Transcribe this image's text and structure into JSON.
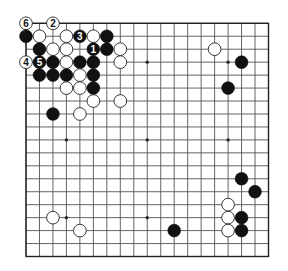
{
  "diagram": {
    "type": "go-board",
    "size": 19,
    "colors": {
      "background": "#ffffff",
      "grid": "#555555",
      "border": "#222222",
      "black_stone": "#111111",
      "white_stone": "#ffffff"
    },
    "hoshi": [
      [
        3,
        3
      ],
      [
        9,
        3
      ],
      [
        15,
        3
      ],
      [
        3,
        9
      ],
      [
        9,
        9
      ],
      [
        15,
        9
      ],
      [
        3,
        15
      ],
      [
        9,
        15
      ],
      [
        15,
        15
      ]
    ],
    "stones": [
      {
        "color": "white",
        "col": 0,
        "row": 0,
        "label": "6"
      },
      {
        "color": "white",
        "col": 2,
        "row": 0,
        "label": "2"
      },
      {
        "color": "black",
        "col": 0,
        "row": 1,
        "label": ""
      },
      {
        "color": "white",
        "col": 1,
        "row": 1,
        "label": ""
      },
      {
        "color": "white",
        "col": 3,
        "row": 1,
        "label": ""
      },
      {
        "color": "black",
        "col": 4,
        "row": 1,
        "label": "3"
      },
      {
        "color": "white",
        "col": 5,
        "row": 1,
        "label": ""
      },
      {
        "color": "black",
        "col": 6,
        "row": 1,
        "label": ""
      },
      {
        "color": "black",
        "col": 1,
        "row": 2,
        "label": ""
      },
      {
        "color": "white",
        "col": 2,
        "row": 2,
        "label": ""
      },
      {
        "color": "white",
        "col": 3,
        "row": 2,
        "label": ""
      },
      {
        "color": "black",
        "col": 5,
        "row": 2,
        "label": "1"
      },
      {
        "color": "black",
        "col": 6,
        "row": 2,
        "label": ""
      },
      {
        "color": "white",
        "col": 7,
        "row": 2,
        "label": ""
      },
      {
        "color": "white",
        "col": 14,
        "row": 2,
        "label": ""
      },
      {
        "color": "white",
        "col": 0,
        "row": 3,
        "label": "4"
      },
      {
        "color": "black",
        "col": 1,
        "row": 3,
        "label": "5"
      },
      {
        "color": "black",
        "col": 2,
        "row": 3,
        "label": ""
      },
      {
        "color": "white",
        "col": 3,
        "row": 3,
        "label": ""
      },
      {
        "color": "black",
        "col": 4,
        "row": 3,
        "label": ""
      },
      {
        "color": "black",
        "col": 5,
        "row": 3,
        "label": ""
      },
      {
        "color": "white",
        "col": 7,
        "row": 3,
        "label": ""
      },
      {
        "color": "black",
        "col": 16,
        "row": 3,
        "label": ""
      },
      {
        "color": "black",
        "col": 1,
        "row": 4,
        "label": ""
      },
      {
        "color": "black",
        "col": 2,
        "row": 4,
        "label": ""
      },
      {
        "color": "black",
        "col": 3,
        "row": 4,
        "label": ""
      },
      {
        "color": "white",
        "col": 4,
        "row": 4,
        "label": ""
      },
      {
        "color": "black",
        "col": 5,
        "row": 4,
        "label": ""
      },
      {
        "color": "white",
        "col": 3,
        "row": 5,
        "label": ""
      },
      {
        "color": "white",
        "col": 4,
        "row": 5,
        "label": ""
      },
      {
        "color": "black",
        "col": 5,
        "row": 5,
        "label": ""
      },
      {
        "color": "black",
        "col": 15,
        "row": 5,
        "label": ""
      },
      {
        "color": "white",
        "col": 5,
        "row": 6,
        "label": ""
      },
      {
        "color": "white",
        "col": 7,
        "row": 6,
        "label": ""
      },
      {
        "color": "black",
        "col": 2,
        "row": 7,
        "label": ""
      },
      {
        "color": "white",
        "col": 4,
        "row": 7,
        "label": ""
      },
      {
        "color": "black",
        "col": 16,
        "row": 12,
        "label": ""
      },
      {
        "color": "black",
        "col": 17,
        "row": 13,
        "label": ""
      },
      {
        "color": "white",
        "col": 15,
        "row": 14,
        "label": ""
      },
      {
        "color": "white",
        "col": 2,
        "row": 15,
        "label": ""
      },
      {
        "color": "white",
        "col": 15,
        "row": 15,
        "label": ""
      },
      {
        "color": "black",
        "col": 16,
        "row": 15,
        "label": ""
      },
      {
        "color": "white",
        "col": 4,
        "row": 16,
        "label": ""
      },
      {
        "color": "black",
        "col": 11,
        "row": 16,
        "label": ""
      },
      {
        "color": "white",
        "col": 15,
        "row": 16,
        "label": ""
      },
      {
        "color": "black",
        "col": 16,
        "row": 16,
        "label": ""
      }
    ],
    "move_labels": [
      "1",
      "2",
      "3",
      "4",
      "5",
      "6"
    ]
  }
}
